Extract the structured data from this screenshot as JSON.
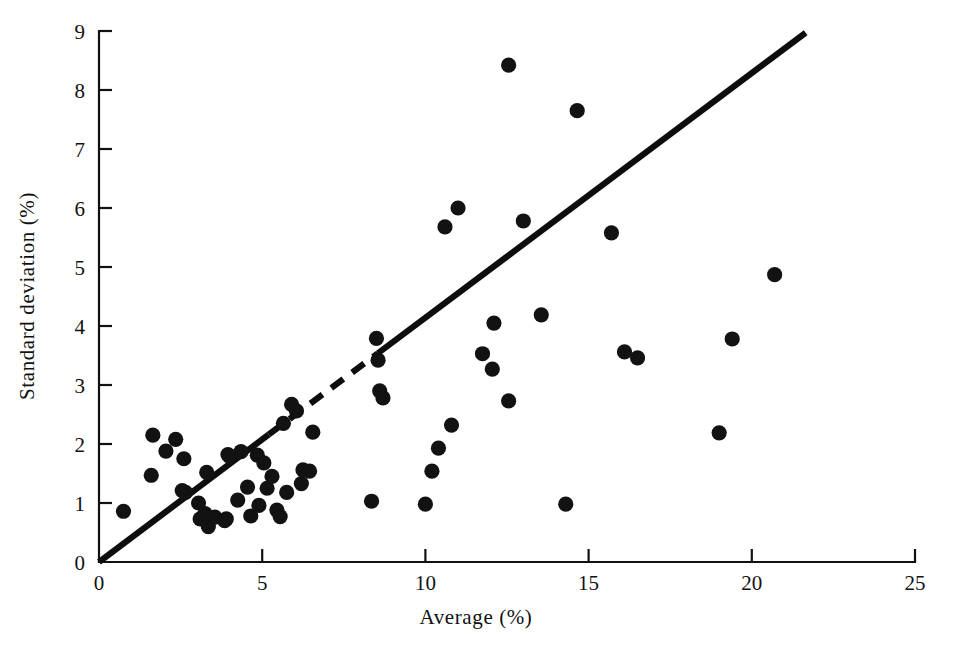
{
  "chart_data": {
    "type": "scatter",
    "title": "",
    "xlabel": "Average (%)",
    "ylabel": "Standard deviation (%)",
    "xlim": [
      0,
      25
    ],
    "ylim": [
      0,
      9
    ],
    "xticks": [
      0,
      5,
      10,
      15,
      20,
      25
    ],
    "yticks": [
      0,
      1,
      2,
      3,
      4,
      5,
      6,
      7,
      8,
      9
    ],
    "xticklabels": [
      "0",
      "5",
      "10",
      "15",
      "20",
      "25"
    ],
    "yticklabels": [
      "0",
      "1",
      "2",
      "3",
      "4",
      "5",
      "6",
      "7",
      "8",
      "9"
    ],
    "grid": false,
    "legend": null,
    "marker": "filled-circle",
    "marker_color": "#121212",
    "marker_size_px": 7.6,
    "series": [
      {
        "name": "observations",
        "points": [
          [
            0.75,
            0.86
          ],
          [
            1.65,
            2.15
          ],
          [
            1.6,
            1.47
          ],
          [
            2.05,
            1.88
          ],
          [
            2.35,
            2.08
          ],
          [
            2.55,
            1.21
          ],
          [
            2.65,
            1.18
          ],
          [
            2.6,
            1.75
          ],
          [
            3.05,
            1.0
          ],
          [
            3.1,
            0.73
          ],
          [
            3.25,
            0.82
          ],
          [
            3.3,
            1.52
          ],
          [
            3.35,
            0.6
          ],
          [
            3.55,
            0.76
          ],
          [
            3.85,
            0.7
          ],
          [
            3.9,
            0.73
          ],
          [
            3.95,
            1.82
          ],
          [
            4.0,
            1.79
          ],
          [
            4.25,
            1.05
          ],
          [
            4.35,
            1.87
          ],
          [
            4.55,
            1.27
          ],
          [
            4.65,
            0.78
          ],
          [
            4.85,
            1.81
          ],
          [
            4.9,
            0.96
          ],
          [
            5.05,
            1.68
          ],
          [
            5.15,
            1.25
          ],
          [
            5.3,
            1.45
          ],
          [
            5.45,
            0.88
          ],
          [
            5.55,
            0.77
          ],
          [
            5.65,
            2.35
          ],
          [
            5.75,
            1.18
          ],
          [
            5.9,
            2.67
          ],
          [
            6.05,
            2.56
          ],
          [
            6.2,
            1.33
          ],
          [
            6.25,
            1.56
          ],
          [
            6.45,
            1.54
          ],
          [
            6.55,
            2.2
          ],
          [
            8.5,
            3.79
          ],
          [
            8.55,
            3.42
          ],
          [
            8.6,
            2.9
          ],
          [
            8.7,
            2.78
          ],
          [
            8.35,
            1.03
          ],
          [
            10.0,
            0.98
          ],
          [
            10.2,
            1.54
          ],
          [
            10.4,
            1.93
          ],
          [
            10.6,
            5.68
          ],
          [
            10.8,
            2.32
          ],
          [
            11.0,
            6.0
          ],
          [
            11.75,
            3.53
          ],
          [
            12.05,
            3.27
          ],
          [
            12.1,
            4.05
          ],
          [
            12.55,
            2.73
          ],
          [
            12.55,
            8.42
          ],
          [
            13.0,
            5.78
          ],
          [
            13.55,
            4.19
          ],
          [
            14.3,
            0.98
          ],
          [
            14.65,
            7.65
          ],
          [
            15.7,
            5.58
          ],
          [
            16.1,
            3.56
          ],
          [
            16.5,
            3.46
          ],
          [
            19.0,
            2.19
          ],
          [
            19.4,
            3.78
          ],
          [
            20.7,
            4.87
          ]
        ]
      }
    ],
    "trendline": {
      "name": "fitted line",
      "from": [
        0,
        0
      ],
      "to": [
        21.65,
        8.97
      ],
      "slope": 0.414,
      "intercept": 0,
      "style": "solid with dashed mid-segment",
      "dashed_segment": [
        [
          5.2,
          2.16
        ],
        [
          8.55,
          3.54
        ]
      ],
      "color": "#0d0d0d"
    }
  },
  "axes": {
    "x_axis_name": "x-axis",
    "y_axis_name": "y-axis"
  }
}
